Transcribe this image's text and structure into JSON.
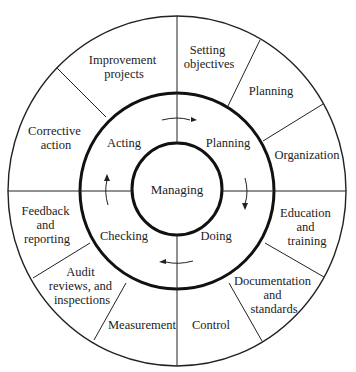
{
  "diagram": {
    "center": {
      "label": "Managing"
    },
    "cycle": [
      {
        "label": "Planning",
        "position": "upper-right"
      },
      {
        "label": "Doing",
        "position": "lower-right"
      },
      {
        "label": "Checking",
        "position": "lower-left"
      },
      {
        "label": "Acting",
        "position": "upper-left"
      }
    ],
    "cycle_direction": "clockwise",
    "outer_segments": {
      "planning": [
        {
          "lines": [
            "Setting",
            "objectives"
          ]
        },
        {
          "lines": [
            "Planning"
          ]
        },
        {
          "lines": [
            "Organization"
          ]
        }
      ],
      "doing": [
        {
          "lines": [
            "Education",
            "and",
            "training"
          ]
        },
        {
          "lines": [
            "Documentation",
            "and",
            "standards"
          ]
        },
        {
          "lines": [
            "Control"
          ]
        }
      ],
      "checking": [
        {
          "lines": [
            "Measurement"
          ]
        },
        {
          "lines": [
            "Audit",
            "reviews, and",
            "inspections"
          ]
        },
        {
          "lines": [
            "Feedback",
            "and",
            "reporting"
          ]
        }
      ],
      "acting": [
        {
          "lines": [
            "Corrective",
            "action"
          ]
        },
        {
          "lines": [
            "Improvement",
            "projects"
          ]
        }
      ]
    }
  }
}
